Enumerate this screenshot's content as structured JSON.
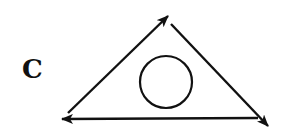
{
  "diagram": {
    "label": "C",
    "stroke_color": "#111111",
    "vertices": {
      "top": [
        168,
        16
      ],
      "bottom_left": [
        62,
        119
      ],
      "bottom_right": [
        268,
        126
      ]
    },
    "arrows": [
      {
        "from": "bottom_left",
        "to": "top"
      },
      {
        "from": "top",
        "to": "bottom_right"
      },
      {
        "from": "bottom_right",
        "to": "bottom_left"
      }
    ],
    "inner_circle": {
      "cx": 166,
      "cy": 92,
      "r": 26
    }
  }
}
